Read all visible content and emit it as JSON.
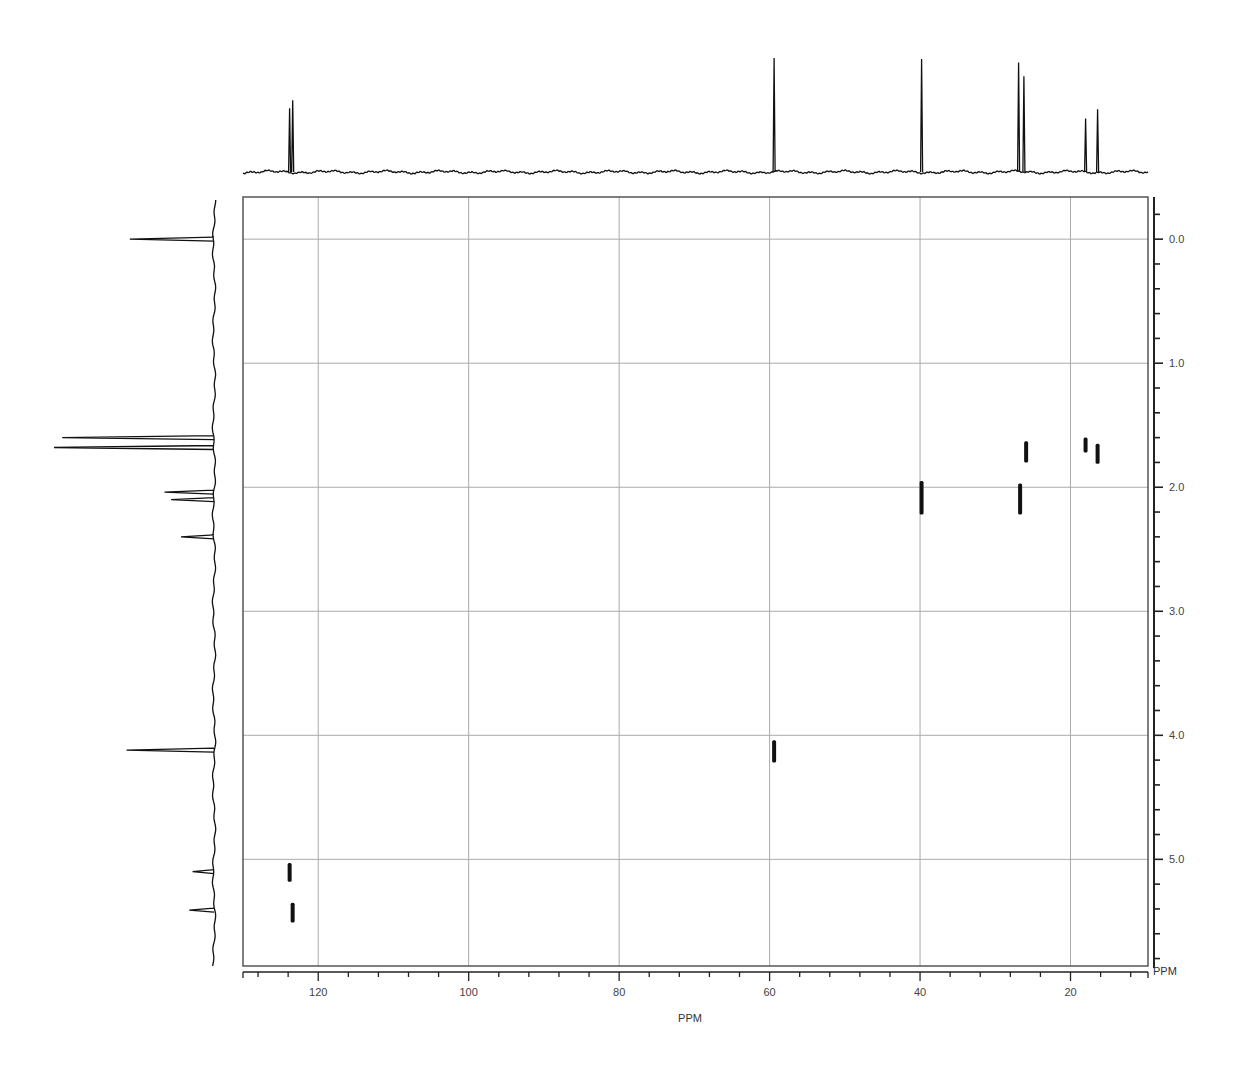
{
  "chart_data": {
    "type": "heatmap",
    "subtype": "2D NMR HSQC contour plot with 1D projections",
    "title": "",
    "xlabel": "PPM",
    "ylabel": "PPM",
    "x_axis": {
      "label": "PPM",
      "range": [
        130,
        9.7
      ],
      "reversed": true,
      "major_ticks": [
        120,
        100,
        80,
        60,
        40,
        20
      ],
      "tick_labels": [
        "120",
        "100",
        "80",
        "60",
        "40",
        "20"
      ],
      "minor_tick_step": 4
    },
    "y_axis": {
      "label": "PPM",
      "position": "right",
      "range": [
        -0.34,
        5.86
      ],
      "reversed": true,
      "major_ticks": [
        0.0,
        1.0,
        2.0,
        3.0,
        4.0,
        5.0
      ],
      "tick_labels": [
        "0.0",
        "1.0",
        "2.0",
        "3.0",
        "4.0",
        "5.0"
      ],
      "minor_tick_step": 0.2
    },
    "grid": true,
    "cross_peaks": [
      {
        "c_ppm": 123.8,
        "h_ppm_start": 5.03,
        "h_ppm_end": 5.18
      },
      {
        "c_ppm": 123.4,
        "h_ppm_start": 5.35,
        "h_ppm_end": 5.51
      },
      {
        "c_ppm": 59.4,
        "h_ppm_start": 4.04,
        "h_ppm_end": 4.22
      },
      {
        "c_ppm": 39.8,
        "h_ppm_start": 1.95,
        "h_ppm_end": 2.22
      },
      {
        "c_ppm": 26.7,
        "h_ppm_start": 1.97,
        "h_ppm_end": 2.22
      },
      {
        "c_ppm": 25.9,
        "h_ppm_start": 1.63,
        "h_ppm_end": 1.8
      },
      {
        "c_ppm": 18.0,
        "h_ppm_start": 1.6,
        "h_ppm_end": 1.72
      },
      {
        "c_ppm": 16.4,
        "h_ppm_start": 1.65,
        "h_ppm_end": 1.81
      }
    ],
    "c13_projection_peaks": [
      {
        "ppm": 123.8,
        "rel_height": 0.56
      },
      {
        "ppm": 123.4,
        "rel_height": 0.63
      },
      {
        "ppm": 59.4,
        "rel_height": 1.0
      },
      {
        "ppm": 39.8,
        "rel_height": 0.99
      },
      {
        "ppm": 26.9,
        "rel_height": 0.96
      },
      {
        "ppm": 26.2,
        "rel_height": 0.84
      },
      {
        "ppm": 18.0,
        "rel_height": 0.47
      },
      {
        "ppm": 16.4,
        "rel_height": 0.55
      }
    ],
    "h1_projection_peaks": [
      {
        "ppm": 0.0,
        "rel_height": 0.51,
        "note": "TMS"
      },
      {
        "ppm": 1.6,
        "rel_height": 0.92
      },
      {
        "ppm": 1.68,
        "rel_height": 0.97
      },
      {
        "ppm": 2.04,
        "rel_height": 0.3
      },
      {
        "ppm": 2.1,
        "rel_height": 0.26
      },
      {
        "ppm": 2.4,
        "rel_height": 0.2
      },
      {
        "ppm": 4.12,
        "rel_height": 0.53
      },
      {
        "ppm": 5.1,
        "rel_height": 0.13
      },
      {
        "ppm": 5.41,
        "rel_height": 0.15
      }
    ]
  },
  "labels": {
    "x_axis_title": "PPM",
    "x_axis_unit_end": "PPM",
    "x_ticks": [
      "120",
      "100",
      "80",
      "60",
      "40",
      "20"
    ],
    "y_ticks": [
      "0.0",
      "1.0",
      "2.0",
      "3.0",
      "4.0",
      "5.0"
    ]
  }
}
